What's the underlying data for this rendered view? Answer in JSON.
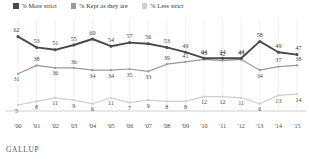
{
  "legend": {
    "items": [
      {
        "label": "% More strict",
        "color": "#4a4a4a",
        "key": "more_strict"
      },
      {
        "label": "% Kept as they are",
        "color": "#9a9a9a",
        "key": "kept_as_they_are"
      },
      {
        "label": "% Less strict",
        "color": "#cfcfcf",
        "key": "less_strict"
      }
    ]
  },
  "source": {
    "label": "GALLUP"
  },
  "chart_data": {
    "type": "line",
    "title": "",
    "subtitle": "",
    "xlabel": "",
    "ylabel": "",
    "grid": "vertical",
    "legend_position": "top-left",
    "ylim": [
      0,
      70
    ],
    "categories": [
      "'00",
      "'01",
      "'02",
      "'03",
      "'04",
      "'05",
      "'06",
      "'07",
      "'08",
      "'09",
      "'10",
      "'11",
      "'12",
      "'13",
      "'14",
      "'15"
    ],
    "series": [
      {
        "name": "% More strict",
        "color": "#4a4a4a",
        "values": [
          62,
          53,
          51,
          55,
          60,
          54,
          57,
          56,
          53,
          49,
          44,
          44,
          44,
          58,
          49,
          47
        ]
      },
      {
        "name": "% Kept as they are",
        "color": "#9a9a9a",
        "values": [
          31,
          38,
          36,
          36,
          34,
          34,
          35,
          33,
          39,
          41,
          43,
          42,
          43,
          34,
          37,
          38
        ]
      },
      {
        "name": "% Less strict",
        "color": "#cfcfcf",
        "values": [
          5,
          8,
          11,
          9,
          6,
          11,
          7,
          9,
          8,
          8,
          12,
          12,
          11,
          6,
          13,
          14
        ]
      }
    ]
  }
}
